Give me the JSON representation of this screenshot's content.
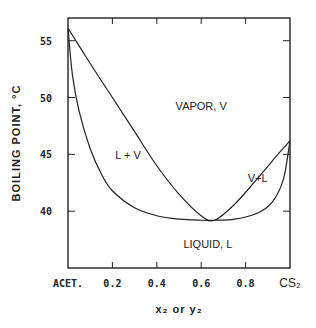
{
  "chart_data": {
    "type": "line",
    "title": "",
    "xlabel": "x₂ or y₂",
    "ylabel": "BOILING POINT, °C",
    "xlim": [
      0,
      1
    ],
    "ylim": [
      35,
      57
    ],
    "x_ticks": [
      {
        "value": 0,
        "label": "ACET."
      },
      {
        "value": 0.2,
        "label": "0.2"
      },
      {
        "value": 0.4,
        "label": "0.4"
      },
      {
        "value": 0.6,
        "label": "0.6"
      },
      {
        "value": 0.8,
        "label": "0.8"
      },
      {
        "value": 1.0,
        "label": "CS₂"
      }
    ],
    "y_ticks": [
      {
        "value": 40,
        "label": "40"
      },
      {
        "value": 45,
        "label": "45"
      },
      {
        "value": 50,
        "label": "50"
      },
      {
        "value": 55,
        "label": "55"
      }
    ],
    "grid": false,
    "series": [
      {
        "name": "vapor (dew) curve",
        "x": [
          0,
          0.1,
          0.2,
          0.3,
          0.4,
          0.5,
          0.6,
          0.66,
          0.75,
          0.85,
          0.95,
          1.0
        ],
        "y": [
          56.1,
          53.0,
          50.0,
          47.0,
          44.0,
          41.5,
          39.6,
          39.2,
          40.6,
          42.8,
          45.1,
          46.2
        ]
      },
      {
        "name": "liquid (bubble) curve",
        "x": [
          0,
          0.02,
          0.05,
          0.1,
          0.15,
          0.2,
          0.3,
          0.4,
          0.5,
          0.6,
          0.66,
          0.75,
          0.85,
          0.92,
          0.97,
          1.0
        ],
        "y": [
          56.1,
          52.0,
          48.8,
          45.5,
          43.3,
          41.8,
          40.3,
          39.6,
          39.3,
          39.2,
          39.2,
          39.3,
          39.8,
          40.8,
          42.8,
          46.2
        ]
      }
    ],
    "annotations": [
      {
        "text": "VAPOR, V",
        "x": 0.6,
        "y": 48.9
      },
      {
        "text": "L + V",
        "x": 0.27,
        "y": 44.6
      },
      {
        "text": "V+L",
        "x": 0.855,
        "y": 42.6
      },
      {
        "text": "LIQUID, L",
        "x": 0.63,
        "y": 36.8
      }
    ]
  }
}
